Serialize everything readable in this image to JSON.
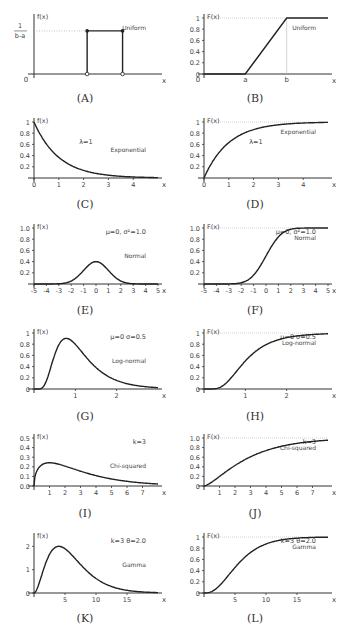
{
  "chart_data": [
    {
      "id": "A",
      "caption": "(A)",
      "type": "line",
      "kind": "pdf",
      "title": "Uniform",
      "ylabel": "f(x)",
      "xlabel": "x",
      "ytick_top_numerator": "1",
      "ytick_top_denominator": "b-a",
      "xticks": [
        "0"
      ],
      "points": [
        [
          0,
          0
        ],
        [
          1,
          0
        ],
        [
          1,
          1
        ],
        [
          2,
          1
        ],
        [
          2,
          0
        ],
        [
          3,
          0
        ]
      ],
      "markers_filled": [
        [
          1,
          1
        ],
        [
          2,
          1
        ]
      ],
      "markers_open": [
        [
          1,
          0
        ],
        [
          2,
          0
        ]
      ],
      "xlim": [
        -0.5,
        3
      ],
      "ylim": [
        0,
        1.3
      ]
    },
    {
      "id": "B",
      "caption": "(B)",
      "type": "line",
      "kind": "cdf",
      "title": "Uniform",
      "ylabel": "F(x)",
      "xlabel": "x",
      "yticks": [
        "0",
        "0.2",
        "0.4",
        "0.6",
        "0.8",
        "1"
      ],
      "xticks": [
        "0",
        "a",
        "b"
      ],
      "points": [
        [
          0,
          0
        ],
        [
          1,
          0
        ],
        [
          2,
          1
        ],
        [
          3,
          1
        ]
      ],
      "xlim": [
        0,
        3
      ],
      "ylim": [
        0,
        1
      ]
    },
    {
      "id": "C",
      "caption": "(C)",
      "type": "line",
      "kind": "pdf",
      "title": "Exponential",
      "param": "λ=1",
      "ylabel": "f(x)",
      "xlabel": "x",
      "yticks": [
        "0.2",
        "0.4",
        "0.6",
        "0.8",
        "1"
      ],
      "xticks": [
        "0",
        "1",
        "2",
        "3",
        "4"
      ],
      "dist": "exp_pdf",
      "lambda": 1,
      "xlim": [
        0,
        5
      ],
      "ylim": [
        0,
        1
      ]
    },
    {
      "id": "D",
      "caption": "(D)",
      "type": "line",
      "kind": "cdf",
      "title": "Exponential",
      "param": "λ=1",
      "ylabel": "F(x)",
      "xlabel": "x",
      "yticks": [
        "0.2",
        "0.4",
        "0.6",
        "0.8",
        "1"
      ],
      "xticks": [
        "0",
        "1",
        "2",
        "3",
        "4"
      ],
      "dist": "exp_cdf",
      "lambda": 1,
      "xlim": [
        0,
        5
      ],
      "ylim": [
        0,
        1
      ]
    },
    {
      "id": "E",
      "caption": "(E)",
      "type": "line",
      "kind": "pdf",
      "title": "Normal",
      "param": "μ=0, σ²=1.0",
      "ylabel": "f(x)",
      "xlabel": "x",
      "yticks": [
        "0.2",
        "0.4",
        "0.6",
        "0.8",
        "1.0"
      ],
      "xticks": [
        "-5",
        "-4",
        "-3",
        "-2",
        "-1",
        "0",
        "1",
        "2",
        "3",
        "4",
        "5"
      ],
      "dist": "norm_pdf",
      "mu": 0,
      "sigma": 1,
      "xlim": [
        -5,
        5
      ],
      "ylim": [
        0,
        1
      ]
    },
    {
      "id": "F",
      "caption": "(F)",
      "type": "line",
      "kind": "cdf",
      "title": "Normal",
      "param": "μ=0, σ²=1.0",
      "ylabel": "F(x)",
      "xlabel": "x",
      "yticks": [
        "0.2",
        "0.4",
        "0.6",
        "0.8",
        "1.0"
      ],
      "xticks": [
        "-5",
        "-4",
        "-3",
        "-2",
        "-1",
        "0",
        "1",
        "2",
        "3",
        "4",
        "5"
      ],
      "dist": "norm_cdf",
      "mu": 0,
      "sigma": 1,
      "xlim": [
        -5,
        5
      ],
      "ylim": [
        0,
        1
      ]
    },
    {
      "id": "G",
      "caption": "(G)",
      "type": "line",
      "kind": "pdf",
      "title": "Log-normal",
      "param": "μ=0  σ=0.5",
      "ylabel": "f(x)",
      "xlabel": "x",
      "yticks": [
        "0",
        "0.2",
        "0.4",
        "0.6",
        "0.8",
        "1"
      ],
      "xticks": [
        "1",
        "2"
      ],
      "dist": "lognorm_pdf",
      "mu": 0,
      "sigma": 0.5,
      "xlim": [
        0,
        3
      ],
      "ylim": [
        0,
        1
      ]
    },
    {
      "id": "H",
      "caption": "(H)",
      "type": "line",
      "kind": "cdf",
      "title": "Log-normal",
      "param": "μ=0  σ=0.5",
      "ylabel": "F(x)",
      "xlabel": "x",
      "yticks": [
        "0",
        "0.2",
        "0.4",
        "0.6",
        "0.8",
        "1"
      ],
      "xticks": [
        "1",
        "2"
      ],
      "dist": "lognorm_cdf",
      "mu": 0,
      "sigma": 0.5,
      "xlim": [
        0,
        3
      ],
      "ylim": [
        0,
        1
      ]
    },
    {
      "id": "I",
      "caption": "(I)",
      "type": "line",
      "kind": "pdf",
      "title": "Chi-squared",
      "param": "k=3",
      "ylabel": "f(x)",
      "xlabel": "x",
      "yticks": [
        "0.0",
        "0.1",
        "0.2",
        "0.3",
        "0.4",
        "0.5"
      ],
      "xticks": [
        "1",
        "2",
        "3",
        "4",
        "5",
        "6",
        "7"
      ],
      "dist": "chi2_pdf",
      "k": 3,
      "xlim": [
        0,
        8
      ],
      "ylim": [
        0,
        0.5
      ]
    },
    {
      "id": "J",
      "caption": "(J)",
      "type": "line",
      "kind": "cdf",
      "title": "Chi-squared",
      "param": "k=3",
      "ylabel": "F(x)",
      "xlabel": "x",
      "yticks": [
        "0",
        "0.2",
        "0.4",
        "0.6",
        "0.8",
        "1.0"
      ],
      "xticks": [
        "1",
        "2",
        "3",
        "4",
        "5",
        "6",
        "7"
      ],
      "dist": "chi2_cdf",
      "k": 3,
      "xlim": [
        0,
        8
      ],
      "ylim": [
        0,
        1
      ]
    },
    {
      "id": "K",
      "caption": "(K)",
      "type": "line",
      "kind": "pdf",
      "title": "Gamma",
      "param": "k=3  θ=2.0",
      "ylabel": "f(x)",
      "xlabel": "x",
      "yticks": [
        "0",
        "1",
        "2"
      ],
      "xticks": [
        "5",
        "10",
        "15"
      ],
      "dist": "gamma_pdf_scaled",
      "k": 3,
      "theta": 2.0,
      "peak": 2.0,
      "xlim": [
        0,
        20
      ],
      "ylim": [
        0,
        2.4
      ]
    },
    {
      "id": "L",
      "caption": "(L)",
      "type": "line",
      "kind": "cdf",
      "title": "Gamma",
      "param": "k=3  θ=2.0",
      "ylabel": "F(x)",
      "xlabel": "x",
      "yticks": [
        "0",
        "0.2",
        "0.4",
        "0.6",
        "0.8",
        "1"
      ],
      "xticks": [
        "5",
        "10",
        "15"
      ],
      "dist": "gamma_cdf",
      "k": 3,
      "theta": 2.0,
      "xlim": [
        0,
        20
      ],
      "ylim": [
        0,
        1
      ]
    }
  ]
}
